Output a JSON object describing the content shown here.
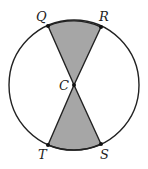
{
  "diagram": {
    "type": "circle-with-vertical-sectors",
    "colors": {
      "stroke": "#222222",
      "fill": "#a6a6a6",
      "background": "#ffffff"
    },
    "circle": {
      "center": [
        74,
        85
      ],
      "radius": 65
    },
    "points": {
      "Q": {
        "label": "Q",
        "xy": [
          48,
          26
        ]
      },
      "R": {
        "label": "R",
        "xy": [
          101,
          27
        ]
      },
      "C": {
        "label": "C",
        "xy": [
          74,
          85
        ]
      },
      "T": {
        "label": "T",
        "xy": [
          48,
          145
        ]
      },
      "S": {
        "label": "S",
        "xy": [
          101,
          144
        ]
      }
    },
    "shaded_regions": [
      "sector QCR",
      "sector TCS"
    ]
  }
}
